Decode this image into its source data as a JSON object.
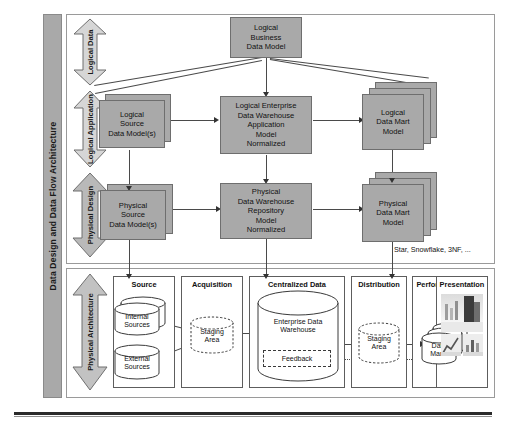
{
  "figure": {
    "side_title": "Data Design and Data Flow Architecture"
  },
  "phases": [
    {
      "label": "Logical Data",
      "direction": "double"
    },
    {
      "label": "Logical Application",
      "direction": "double"
    },
    {
      "label": "Physical Design",
      "direction": "double"
    },
    {
      "label": "Physical Architecture",
      "direction": "double"
    }
  ],
  "models": {
    "logical_business": "Logical\nBusiness\nData Model",
    "logical_source": "Logical\nSource\nData Model(s)",
    "logical_edw": "Logical Enterprise\nData Warehouse\nApplication\nModel\nNormalized",
    "logical_mart": "Logical\nData Mart\nModel",
    "physical_source": "Physical\nSource\nData Model(s)",
    "physical_repo": "Physical\nData Warehouse\nRepository\nModel\nNormalized",
    "physical_mart": "Physical\nData Mart\nModel"
  },
  "annotations": {
    "schema_note": "Star, Snowflake, 3NF, ..."
  },
  "architecture": {
    "columns": [
      {
        "header": "Source"
      },
      {
        "header": "Acquisition"
      },
      {
        "header": "Centralized Data"
      },
      {
        "header": "Distribution"
      },
      {
        "header": "Performance"
      },
      {
        "header": "Presentation"
      }
    ],
    "nodes": {
      "internal_sources": "Internal\nSources",
      "external_sources": "External\nSources",
      "staging_area_1": "Staging\nArea",
      "enterprise_dw": "Enterprise Data\nWarehouse",
      "feedback": "Feedback",
      "staging_area_2": "Staging\nArea",
      "data_marts": "Data\nMarts"
    }
  },
  "colors": {
    "box_fill": "#a9a9a9",
    "box_stroke": "#6e6e6e",
    "panel_stroke": "#9a9a9a",
    "line": "#4a4a4a",
    "title_bar": "#a9a9a9"
  }
}
